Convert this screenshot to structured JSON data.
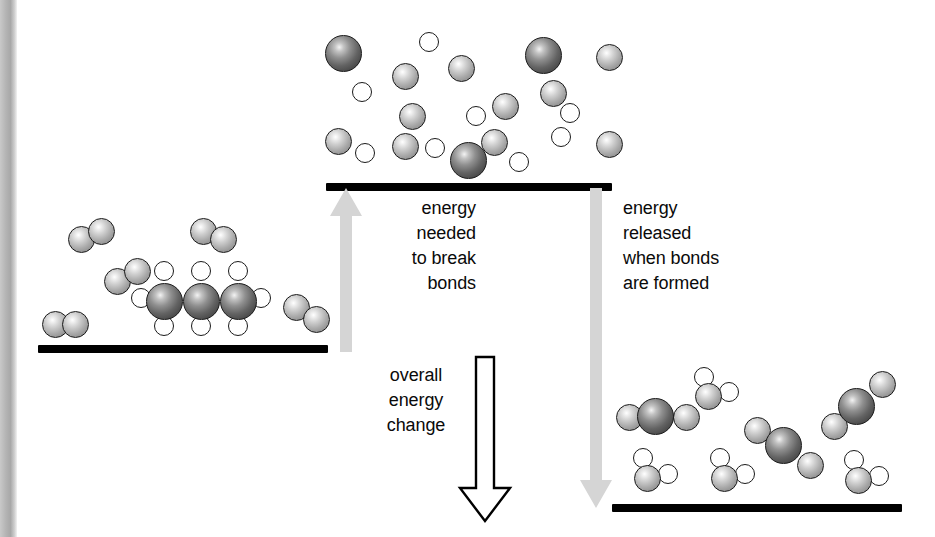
{
  "diagram": {
    "background_color": "#ffffff",
    "line_color": "#000000",
    "arrow_gray": "#d5d5d5",
    "outline_arrow_fill": "#ffffff",
    "outline_arrow_stroke": "#000000"
  },
  "labels": {
    "break_bonds": "energy\nneeded\nto break\nbonds",
    "form_bonds": "energy\nreleased\nwhen bonds\nare formed",
    "overall_change": "overall\nenergy\nchange"
  },
  "levels": [
    {
      "name": "reactants",
      "label": "reactants level",
      "x": 38,
      "y": 345,
      "width": 290
    },
    {
      "name": "transition",
      "label": "broken bonds level",
      "x": 326,
      "y": 183,
      "width": 286
    },
    {
      "name": "products",
      "label": "products level",
      "x": 612,
      "y": 504,
      "width": 290
    }
  ],
  "arrows": {
    "up_break": {
      "name": "energy-in-arrow",
      "direction": "up",
      "color": "#d5d5d5",
      "x": 332,
      "y_top": 192,
      "y_bottom": 348
    },
    "down_release": {
      "name": "energy-out-arrow",
      "direction": "down",
      "color": "#d5d5d5",
      "x": 582,
      "y_top": 190,
      "y_bottom": 506
    },
    "down_overall": {
      "name": "overall-change-arrow",
      "direction": "down",
      "fill": "#ffffff",
      "stroke": "#000000",
      "x": 462,
      "y_top": 358,
      "y_bottom": 518
    }
  },
  "atom_types": {
    "carbon": {
      "name": "carbon-atom",
      "shade": "dark-grey",
      "size": 37
    },
    "oxygen": {
      "name": "oxygen-atom",
      "shade": "mid-grey",
      "size": 27
    },
    "hydrogen": {
      "name": "hydrogen-atom",
      "shade": "white",
      "size": 20
    }
  },
  "scenes": {
    "reactants": {
      "caption": "propane and oxygen molecules",
      "molecules": [
        {
          "name": "propane-molecule",
          "formula": "C3H8",
          "atoms": [
            {
              "t": "carbon",
              "x": 146,
              "y": 283
            },
            {
              "t": "carbon",
              "x": 183,
              "y": 283
            },
            {
              "t": "carbon",
              "x": 220,
              "y": 283
            },
            {
              "t": "hydrogen",
              "x": 154,
              "y": 261
            },
            {
              "t": "hydrogen",
              "x": 191,
              "y": 261
            },
            {
              "t": "hydrogen",
              "x": 228,
              "y": 261
            },
            {
              "t": "hydrogen",
              "x": 154,
              "y": 316
            },
            {
              "t": "hydrogen",
              "x": 191,
              "y": 316
            },
            {
              "t": "hydrogen",
              "x": 228,
              "y": 316
            },
            {
              "t": "hydrogen",
              "x": 131,
              "y": 288
            },
            {
              "t": "hydrogen",
              "x": 251,
              "y": 288
            }
          ]
        },
        {
          "name": "oxygen-molecule",
          "formula": "O2",
          "atoms": [
            {
              "t": "oxygen",
              "x": 68,
              "y": 226
            },
            {
              "t": "oxygen",
              "x": 88,
              "y": 218
            }
          ]
        },
        {
          "name": "oxygen-molecule",
          "formula": "O2",
          "atoms": [
            {
              "t": "oxygen",
              "x": 190,
              "y": 218
            },
            {
              "t": "oxygen",
              "x": 210,
              "y": 226
            }
          ]
        },
        {
          "name": "oxygen-molecule",
          "formula": "O2",
          "atoms": [
            {
              "t": "oxygen",
              "x": 104,
              "y": 268
            },
            {
              "t": "oxygen",
              "x": 124,
              "y": 258
            }
          ]
        },
        {
          "name": "oxygen-molecule",
          "formula": "O2",
          "atoms": [
            {
              "t": "oxygen",
              "x": 42,
              "y": 311
            },
            {
              "t": "oxygen",
              "x": 62,
              "y": 311
            }
          ]
        },
        {
          "name": "oxygen-molecule",
          "formula": "O2",
          "atoms": [
            {
              "t": "oxygen",
              "x": 283,
              "y": 294
            },
            {
              "t": "oxygen",
              "x": 303,
              "y": 306
            }
          ]
        }
      ]
    },
    "transition": {
      "caption": "separated atoms after bonds are broken",
      "molecules": [
        {
          "name": "free-atoms",
          "atoms": [
            {
              "t": "carbon",
              "x": 325,
              "y": 35
            },
            {
              "t": "carbon",
              "x": 525,
              "y": 37
            },
            {
              "t": "carbon",
              "x": 450,
              "y": 142
            },
            {
              "t": "oxygen",
              "x": 392,
              "y": 63
            },
            {
              "t": "oxygen",
              "x": 448,
              "y": 55
            },
            {
              "t": "oxygen",
              "x": 596,
              "y": 44
            },
            {
              "t": "oxygen",
              "x": 540,
              "y": 80
            },
            {
              "t": "oxygen",
              "x": 492,
              "y": 93
            },
            {
              "t": "oxygen",
              "x": 399,
              "y": 103
            },
            {
              "t": "oxygen",
              "x": 325,
              "y": 128
            },
            {
              "t": "oxygen",
              "x": 392,
              "y": 133
            },
            {
              "t": "oxygen",
              "x": 481,
              "y": 129
            },
            {
              "t": "oxygen",
              "x": 596,
              "y": 131
            },
            {
              "t": "hydrogen",
              "x": 419,
              "y": 32
            },
            {
              "t": "hydrogen",
              "x": 352,
              "y": 82
            },
            {
              "t": "hydrogen",
              "x": 466,
              "y": 106
            },
            {
              "t": "hydrogen",
              "x": 560,
              "y": 103
            },
            {
              "t": "hydrogen",
              "x": 551,
              "y": 127
            },
            {
              "t": "hydrogen",
              "x": 355,
              "y": 143
            },
            {
              "t": "hydrogen",
              "x": 425,
              "y": 138
            },
            {
              "t": "hydrogen",
              "x": 509,
              "y": 152
            }
          ]
        }
      ]
    },
    "products": {
      "caption": "carbon dioxide and water molecules",
      "molecules": [
        {
          "name": "carbon-dioxide-molecule",
          "formula": "CO2",
          "atoms": [
            {
              "t": "oxygen",
              "x": 616,
              "y": 404
            },
            {
              "t": "carbon",
              "x": 637,
              "y": 398
            },
            {
              "t": "oxygen",
              "x": 673,
              "y": 404
            }
          ]
        },
        {
          "name": "carbon-dioxide-molecule",
          "formula": "CO2",
          "atoms": [
            {
              "t": "oxygen",
              "x": 744,
              "y": 417
            },
            {
              "t": "carbon",
              "x": 765,
              "y": 427
            },
            {
              "t": "oxygen",
              "x": 797,
              "y": 452
            }
          ]
        },
        {
          "name": "carbon-dioxide-molecule",
          "formula": "CO2",
          "atoms": [
            {
              "t": "oxygen",
              "x": 821,
              "y": 413
            },
            {
              "t": "carbon",
              "x": 838,
              "y": 388
            },
            {
              "t": "oxygen",
              "x": 869,
              "y": 371
            }
          ]
        },
        {
          "name": "water-molecule",
          "formula": "H2O",
          "atoms": [
            {
              "t": "oxygen",
              "x": 695,
              "y": 383
            },
            {
              "t": "hydrogen",
              "x": 694,
              "y": 367
            },
            {
              "t": "hydrogen",
              "x": 719,
              "y": 382
            }
          ]
        },
        {
          "name": "water-molecule",
          "formula": "H2O",
          "atoms": [
            {
              "t": "oxygen",
              "x": 634,
              "y": 465
            },
            {
              "t": "hydrogen",
              "x": 633,
              "y": 448
            },
            {
              "t": "hydrogen",
              "x": 658,
              "y": 464
            }
          ]
        },
        {
          "name": "water-molecule",
          "formula": "H2O",
          "atoms": [
            {
              "t": "oxygen",
              "x": 711,
              "y": 465
            },
            {
              "t": "hydrogen",
              "x": 710,
              "y": 448
            },
            {
              "t": "hydrogen",
              "x": 735,
              "y": 464
            }
          ]
        },
        {
          "name": "water-molecule",
          "formula": "H2O",
          "atoms": [
            {
              "t": "oxygen",
              "x": 845,
              "y": 467
            },
            {
              "t": "hydrogen",
              "x": 844,
              "y": 450
            },
            {
              "t": "hydrogen",
              "x": 869,
              "y": 466
            }
          ]
        }
      ]
    }
  }
}
